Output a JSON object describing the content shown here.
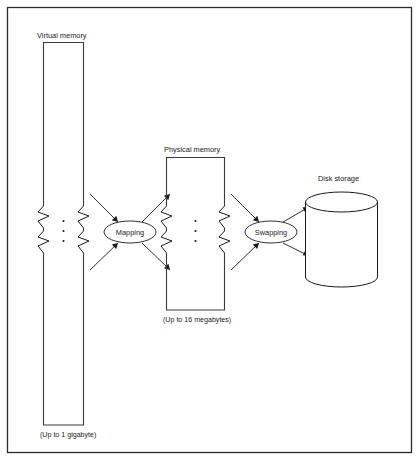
{
  "figure": {
    "background_color": "#ffffff",
    "line_color": "#1a1a1a",
    "frame_color": "#2b2b2b"
  },
  "labels": {
    "virtual_memory": "Virtual memory",
    "virtual_memory_capacity": "(Up to 1 gigabyte)",
    "physical_memory": "Physical memory",
    "physical_memory_capacity": "(Up to 16 megabytes)",
    "disk_storage": "Disk storage",
    "mapping": "Mapping",
    "swapping": "Swapping"
  },
  "nodes": [
    {
      "id": "virtual-memory",
      "kind": "tall-box",
      "label": "Virtual memory",
      "caption": "(Up to 1 gigabyte)",
      "x": 43,
      "y": 42,
      "width": 41,
      "height": 383
    },
    {
      "id": "mapping",
      "kind": "ellipse",
      "label": "Mapping",
      "cx": 130,
      "cy": 232,
      "rx": 26,
      "ry": 11
    },
    {
      "id": "physical-memory",
      "kind": "tall-box",
      "label": "Physical memory",
      "caption": "(Up to 16 megabytes)",
      "x": 166,
      "y": 157,
      "width": 59,
      "height": 153
    },
    {
      "id": "swapping",
      "kind": "ellipse",
      "label": "Swapping",
      "cx": 271,
      "cy": 232,
      "rx": 26,
      "ry": 11
    },
    {
      "id": "disk-storage",
      "kind": "cylinder",
      "label": "Disk storage",
      "x": 305,
      "y": 192,
      "width": 72,
      "height": 85
    }
  ],
  "connections": [
    {
      "from": "virtual-memory",
      "to": "mapping",
      "direction": "into-ellipse",
      "position": "upper"
    },
    {
      "from": "virtual-memory",
      "to": "mapping",
      "direction": "into-ellipse",
      "position": "lower"
    },
    {
      "from": "mapping",
      "to": "physical-memory",
      "direction": "out-of-ellipse",
      "position": "upper"
    },
    {
      "from": "mapping",
      "to": "physical-memory",
      "direction": "out-of-ellipse",
      "position": "lower"
    },
    {
      "from": "physical-memory",
      "to": "swapping",
      "direction": "into-ellipse",
      "position": "upper"
    },
    {
      "from": "physical-memory",
      "to": "swapping",
      "direction": "into-ellipse",
      "position": "lower"
    },
    {
      "from": "swapping",
      "to": "disk-storage",
      "direction": "out-of-ellipse",
      "position": "upper"
    },
    {
      "from": "swapping",
      "to": "disk-storage",
      "direction": "out-of-ellipse",
      "position": "lower"
    }
  ],
  "break_marks": {
    "description": "zigzag break symbols on the vertical sides of the memory boxes",
    "virtual_memory_count": 4,
    "physical_memory_count": 4
  },
  "ellipsis_dots": {
    "description": "vertical three-dot ellipsis inside each memory box",
    "count_per_box": 3
  }
}
